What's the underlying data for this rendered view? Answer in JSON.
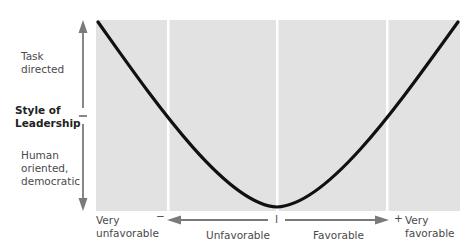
{
  "diagram": {
    "y_axis": {
      "title_line1": "Style of",
      "title_line2": "Leadership",
      "top_label_line1": "Task",
      "top_label_line2": "directed",
      "bottom_label_line1": "Human",
      "bottom_label_line2": "oriented,",
      "bottom_label_line3": "democratic"
    },
    "x_axis": {
      "left_end_line1": "Very",
      "left_end_line2": "unfavorable",
      "left_sign": "−",
      "left_label": "Unfavorable",
      "center_tick": "I",
      "right_label": "Favorable",
      "right_sign": "+",
      "right_end_line1": "Very",
      "right_end_line2": "favorable"
    },
    "panel_count": 4,
    "curve": "U-shaped (parabolic) — task-directed style at both extremes, human-oriented style at the middle",
    "colors": {
      "panel": "#e2e2e2",
      "divider": "#ffffff",
      "curve": "#111111",
      "arrow": "#7a7a7a",
      "text": "#4a4a4a"
    }
  }
}
